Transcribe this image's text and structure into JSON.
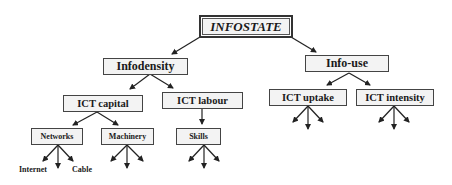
{
  "diagram": {
    "root": {
      "label": "INFOSTATE"
    },
    "level1": [
      {
        "label": "Infodensity"
      },
      {
        "label": "Info-use"
      }
    ],
    "level2": [
      {
        "label": "ICT capital",
        "parent": "Infodensity"
      },
      {
        "label": "ICT labour",
        "parent": "Infodensity"
      },
      {
        "label": "ICT uptake",
        "parent": "Info-use"
      },
      {
        "label": "ICT intensity",
        "parent": "Info-use"
      }
    ],
    "level3": [
      {
        "label": "Networks",
        "parent": "ICT capital"
      },
      {
        "label": "Machinery",
        "parent": "ICT capital"
      },
      {
        "label": "Skills",
        "parent": "ICT labour"
      }
    ],
    "leaves": [
      {
        "label": "Internet",
        "parent": "Networks"
      },
      {
        "label": "Cable",
        "parent": "Networks"
      }
    ],
    "colors": {
      "box_fill": "#f3f3f3",
      "border": "#444444",
      "arrow": "#222222"
    }
  }
}
